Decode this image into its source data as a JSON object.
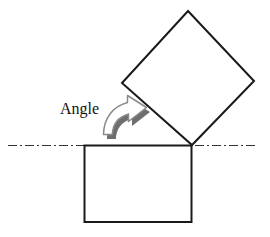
{
  "figure": {
    "type": "geometry-diagram",
    "width": 270,
    "height": 237,
    "background_color": "#ffffff"
  },
  "labels": {
    "angle": "Angle"
  },
  "colors": {
    "stroke": "#1a1a1a",
    "shape_fill": "#ffffff",
    "reference_line": "#333333",
    "arrow_fill": "#ffffff",
    "arrow_stroke": "#8a8a8a",
    "arrow_shadow": "#6e6e6e"
  },
  "shapes": {
    "base_rectangle": {
      "name": "base-square",
      "x": 84,
      "y": 145,
      "width": 108,
      "height": 77,
      "stroke_width": 2,
      "rotation_deg": 0
    },
    "rotated_square": {
      "name": "tilted-square",
      "vertices": [
        [
          188,
          11
        ],
        [
          254,
          81
        ],
        [
          192,
          145
        ],
        [
          122,
          83
        ]
      ],
      "stroke_width": 2,
      "pivot": [
        192,
        145
      ]
    },
    "reference_line": {
      "name": "horizontal-axis",
      "x1": 8,
      "y1": 145,
      "x2": 256,
      "y2": 145,
      "style": "dash-dot",
      "stroke_width": 1.2,
      "dash_pattern": "9 3 2 3"
    }
  },
  "annotations": {
    "rotation_arrow": {
      "name": "curved-rotation-arrow",
      "direction": "clockwise-up-right",
      "shadow_offset": [
        3,
        4
      ]
    },
    "angle_text": {
      "text": "Angle",
      "x": 60,
      "y": 114,
      "font_size": 16
    }
  }
}
